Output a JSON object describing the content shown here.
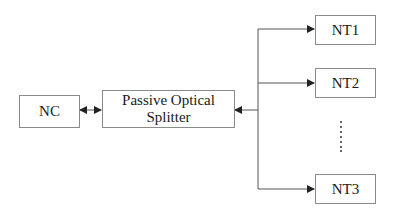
{
  "diagram": {
    "nodes": {
      "nc": {
        "label": "NC"
      },
      "splitter": {
        "label_line1": "Passive Optical",
        "label_line2": "Splitter"
      },
      "nt1": {
        "label": "NT1"
      },
      "nt2": {
        "label": "NT2"
      },
      "nt3": {
        "label": "NT3"
      }
    },
    "ellipsis": "⋮",
    "edges": [
      {
        "from": "NC",
        "to": "Passive Optical Splitter",
        "type": "bidirectional"
      },
      {
        "from": "trunk",
        "to": "Passive Optical Splitter",
        "type": "arrow"
      },
      {
        "from": "trunk",
        "to": "NT1",
        "type": "arrow"
      },
      {
        "from": "trunk",
        "to": "NT2",
        "type": "arrow"
      },
      {
        "from": "trunk",
        "to": "NT3",
        "type": "arrow"
      }
    ],
    "colors": {
      "line": "#555555",
      "box_border": "#8a8a8a",
      "text": "#1a1a1a"
    }
  }
}
